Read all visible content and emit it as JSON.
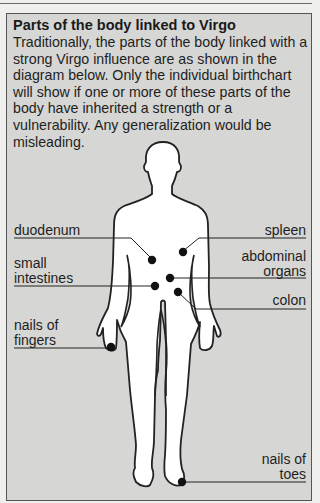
{
  "title": "Parts of the body linked to Virgo",
  "intro": "Traditionally, the parts of the body linked with a strong Virgo influence are as shown in the diagram below. Only the individual birthchart will show if one or more of these parts of the body have inherited a strength or a vulnerability. Any generalization would be misleading.",
  "labels": {
    "duodenum": "duodenum",
    "spleen": "spleen",
    "small_intestines_1": "small",
    "small_intestines_2": "intestines",
    "abdominal_organs_1": "abdominal",
    "abdominal_organs_2": "organs",
    "colon": "colon",
    "nails_fingers_1": "nails of",
    "nails_fingers_2": "fingers",
    "nails_toes_1": "nails of",
    "nails_toes_2": "toes"
  },
  "colors": {
    "panel_bg": "#d6d6d4",
    "figure_fill": "#ffffff",
    "ink": "#1e1e1e"
  }
}
